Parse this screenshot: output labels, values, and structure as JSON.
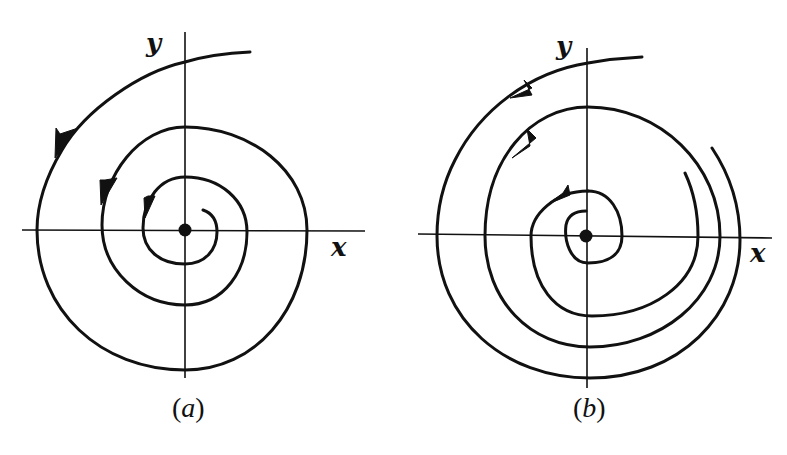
{
  "figure": {
    "panels": [
      {
        "id": "a",
        "caption_open": "(",
        "caption_letter": "a",
        "caption_close": ")",
        "x_label": "x",
        "y_label": "y",
        "description": "Stable focus: trajectory spirals counterclockwise inward toward the equilibrium point at the origin"
      },
      {
        "id": "b",
        "caption_open": "(",
        "caption_letter": "b",
        "caption_close": ")",
        "x_label": "x",
        "y_label": "y",
        "description": "Spiral trajectories winding counterclockwise around the equilibrium point at the origin"
      }
    ],
    "colors": {
      "ink": "#111111",
      "background": "#ffffff"
    }
  }
}
